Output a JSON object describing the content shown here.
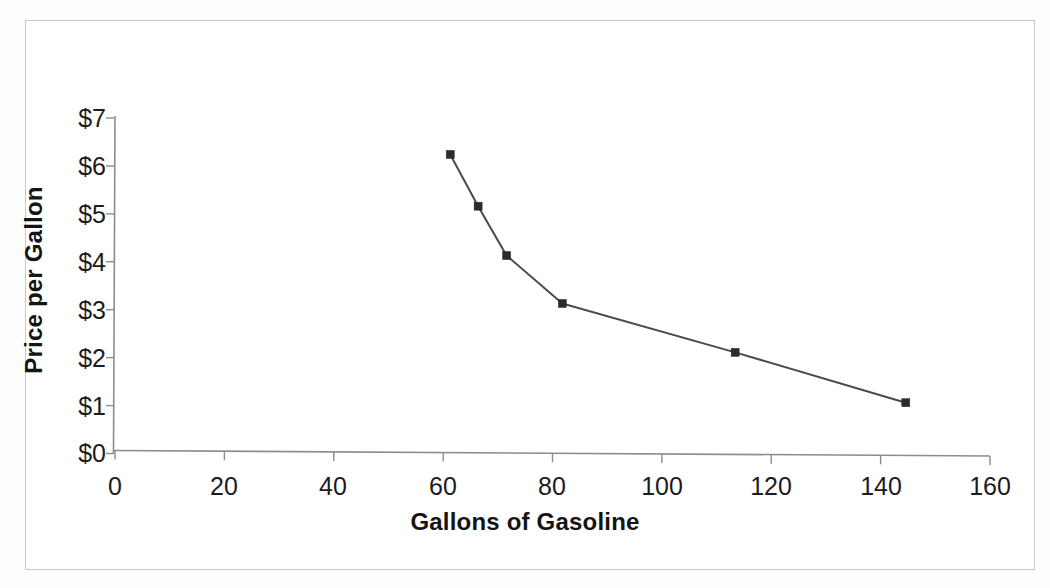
{
  "chart_data": {
    "type": "line",
    "title": "",
    "xlabel": "Gallons of Gasoline",
    "ylabel": "Price per Gallon",
    "xlim": [
      0,
      160
    ],
    "ylim": [
      0,
      7
    ],
    "xticks": [
      "0",
      "20",
      "40",
      "60",
      "80",
      "100",
      "120",
      "140",
      "160"
    ],
    "xtick_values": [
      0,
      20,
      40,
      60,
      80,
      100,
      120,
      140,
      160
    ],
    "yticks": [
      "$0",
      "$1",
      "$2",
      "$3",
      "$4",
      "$5",
      "$6",
      "$7"
    ],
    "ytick_values": [
      0,
      1,
      2,
      3,
      4,
      5,
      6,
      7
    ],
    "grid": false,
    "legend": false,
    "legend_position": "none",
    "marker": "square",
    "line_color": "#4a4a4a",
    "marker_color": "#2b2b2b",
    "series": [
      {
        "name": "Demand",
        "x": [
          61.3,
          66.4,
          71.6,
          81.8,
          113.4,
          144.6
        ],
        "y": [
          6.24,
          5.16,
          4.13,
          3.13,
          2.11,
          1.06
        ]
      }
    ]
  },
  "axes": {
    "axis_color": "#8c8c8c",
    "tick_color": "#8c8c8c"
  },
  "frame": {
    "border_color": "#c9c9c9",
    "background": "#ffffff"
  }
}
